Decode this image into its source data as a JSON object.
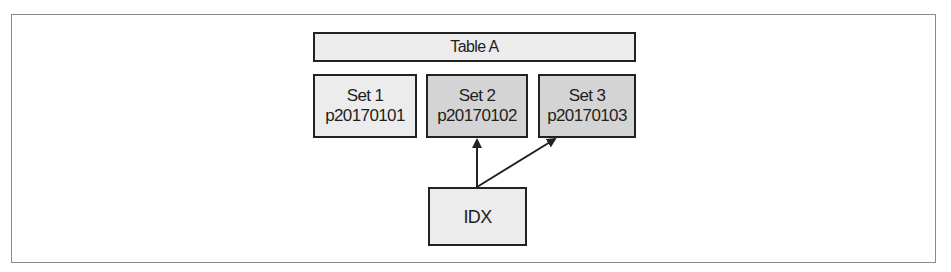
{
  "diagram": {
    "table": {
      "label": "Table A"
    },
    "sets": [
      {
        "name": "Set 1",
        "partition": "p20170101",
        "indexed": false
      },
      {
        "name": "Set 2",
        "partition": "p20170102",
        "indexed": true
      },
      {
        "name": "Set 3",
        "partition": "p20170103",
        "indexed": true
      }
    ],
    "index": {
      "label": "IDX"
    },
    "edges": [
      {
        "from": "IDX",
        "to": "Set 2"
      },
      {
        "from": "IDX",
        "to": "Set 3"
      }
    ],
    "colors": {
      "box_border": "#222222",
      "box_light_fill": "#ececec",
      "box_dark_fill": "#d4d4d4",
      "frame_border": "#8a8a8a",
      "arrow": "#222222"
    }
  }
}
